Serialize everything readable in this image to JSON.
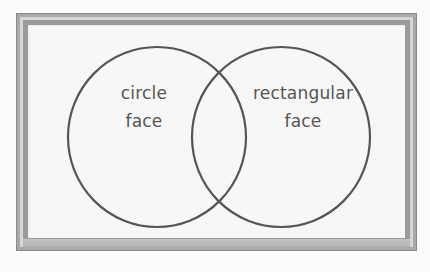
{
  "diagram": {
    "type": "venn",
    "sets": [
      {
        "id": "left",
        "label_line1": "circle",
        "label_line2": "face"
      },
      {
        "id": "right",
        "label_line1": "rectangular",
        "label_line2": "face"
      }
    ],
    "intersection_label": ""
  },
  "colors": {
    "outline": "#555555",
    "text": "#555555",
    "frame": "#a9a9a9",
    "board": "#f7f7f7"
  }
}
